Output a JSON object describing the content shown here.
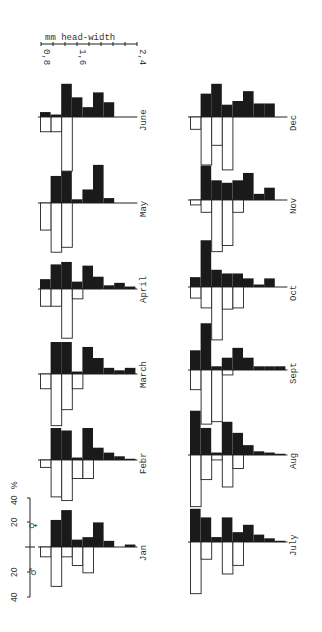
{
  "chart_data": {
    "type": "bar",
    "subtype": "mirrored histogram (population pyramid), rotated 90 degrees",
    "title": "",
    "xlabel": "mm head-width",
    "ylabel": "%",
    "size_axis": {
      "label": "mm head-width",
      "ticks": [
        "0,8",
        "1,6",
        "2,4"
      ],
      "range": [
        0.8,
        2.4
      ],
      "class_width_mm": 0.2
    },
    "percent_axis": {
      "label": "%",
      "ticks": [
        "40",
        "20",
        "0",
        "20",
        "40"
      ],
      "range": [
        -40,
        40
      ]
    },
    "legend": [
      {
        "symbol": "♀",
        "meaning": "females",
        "fill": "#1a1a1a",
        "direction": "up (filled bars)"
      },
      {
        "symbol": "♂",
        "meaning": "males",
        "fill": "#ffffff",
        "direction": "down (open bars)"
      }
    ],
    "size_classes": [
      "0.8-1.0",
      "1.0-1.2",
      "1.2-1.4",
      "1.4-1.6",
      "1.6-1.8",
      "1.8-2.0",
      "2.0-2.2",
      "2.2-2.4",
      "2.4-2.6"
    ],
    "months": [
      {
        "name": "Jan",
        "female": [
          0,
          22,
          30,
          6,
          8,
          20,
          5,
          0,
          2
        ],
        "male": [
          8,
          32,
          8,
          15,
          21,
          0,
          0,
          0,
          0
        ]
      },
      {
        "name": "Febr",
        "female": [
          0,
          26,
          24,
          2,
          26,
          10,
          6,
          3,
          1
        ],
        "male": [
          6,
          30,
          33,
          15,
          15,
          0,
          0,
          0,
          0
        ]
      },
      {
        "name": "March",
        "female": [
          0,
          26,
          26,
          2,
          22,
          13,
          5,
          3,
          5
        ],
        "male": [
          12,
          42,
          29,
          12,
          0,
          0,
          0,
          0,
          0
        ]
      },
      {
        "name": "April",
        "female": [
          8,
          20,
          22,
          6,
          19,
          10,
          3,
          5,
          2
        ],
        "male": [
          14,
          14,
          40,
          8,
          0,
          0,
          0,
          0,
          0
        ]
      },
      {
        "name": "May",
        "female": [
          0,
          22,
          26,
          3,
          11,
          31,
          4,
          0,
          0
        ],
        "male": [
          22,
          40,
          36,
          0,
          0,
          0,
          0,
          0,
          0
        ]
      },
      {
        "name": "June",
        "female": [
          4,
          2,
          27,
          16,
          8,
          20,
          12,
          0,
          0
        ],
        "male": [
          12,
          12,
          44,
          0,
          0,
          0,
          0,
          0,
          0
        ]
      },
      {
        "name": "July",
        "female": [
          27,
          20,
          4,
          20,
          8,
          14,
          6,
          3,
          1
        ],
        "male": [
          42,
          14,
          0,
          26,
          19,
          0,
          0,
          0,
          0
        ]
      },
      {
        "name": "Aug",
        "female": [
          36,
          22,
          2,
          27,
          18,
          8,
          3,
          2,
          1
        ],
        "male": [
          42,
          20,
          4,
          26,
          11,
          0,
          0,
          0,
          0
        ]
      },
      {
        "name": "Sept",
        "female": [
          16,
          38,
          3,
          10,
          18,
          10,
          3,
          3,
          3
        ],
        "male": [
          16,
          44,
          42,
          4,
          0,
          0,
          0,
          0,
          0
        ]
      },
      {
        "name": "Oct",
        "female": [
          8,
          38,
          14,
          11,
          11,
          7,
          2,
          7,
          0
        ],
        "male": [
          9,
          17,
          43,
          18,
          17,
          0,
          0,
          0,
          0
        ]
      },
      {
        "name": "Nov",
        "female": [
          0,
          28,
          16,
          14,
          16,
          22,
          5,
          10,
          0
        ],
        "male": [
          4,
          10,
          42,
          37,
          10,
          0,
          0,
          0,
          0
        ]
      },
      {
        "name": "Dec",
        "female": [
          0,
          19,
          27,
          10,
          13,
          21,
          11,
          11,
          0
        ],
        "male": [
          10,
          39,
          23,
          43,
          0,
          0,
          0,
          0,
          0
        ]
      }
    ],
    "layout": {
      "columns": [
        [
          "June",
          "May",
          "April",
          "March",
          "Febr",
          "Jan"
        ],
        [
          "Dec",
          "Nov",
          "Oct",
          "Sept",
          "Aug",
          "July"
        ]
      ],
      "grid": false,
      "legend_position": "lower-left"
    }
  },
  "labels": {
    "size_axis_title": "mm head-width",
    "size_tick_min": "0,8",
    "size_tick_mid": "1,6",
    "size_tick_max": "2,4",
    "pct_unit": "%",
    "pct_ticks": [
      "40",
      "20",
      "20",
      "40"
    ],
    "female_symbol": "♀",
    "male_symbol": "♂"
  }
}
